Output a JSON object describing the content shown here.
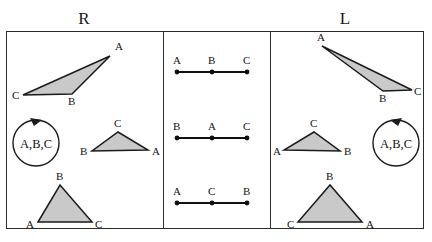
{
  "figure": {
    "width": 432,
    "height": 242,
    "background_color": "#ffffff",
    "border_color": "#2b2b2b",
    "shape_fill_color": "#c9c9c9",
    "shape_stroke_color": "#1b1b1b",
    "line_color": "#121212"
  },
  "headings": {
    "right_column": "R",
    "middle_column": "",
    "left_column": "L"
  },
  "panels": {
    "right_panel": {
      "name": "R",
      "orientation_marker": {
        "label": "A,B,C",
        "direction": "counterclockwise"
      },
      "triangles": [
        {
          "id": "r-triangle-1",
          "vertex_order": [
            "A",
            "B",
            "C"
          ],
          "labels": {
            "A": "A",
            "B": "B",
            "C": "C"
          },
          "points": {
            "A": [
              110,
              56
            ],
            "B": [
              72,
              94
            ],
            "C": [
              23,
              95
            ]
          },
          "label_pos": {
            "A": [
              115,
              50
            ],
            "B": [
              68,
              105
            ],
            "C": [
              12,
              99
            ]
          },
          "shape": "obtuse-sliver"
        },
        {
          "id": "r-triangle-2",
          "vertex_order": [
            "A",
            "B",
            "C"
          ],
          "labels": {
            "A": "A",
            "B": "B",
            "C": "C"
          },
          "points": {
            "A": [
              148,
              150
            ],
            "B": [
              92,
              151
            ],
            "C": [
              118,
              132
            ]
          },
          "label_pos": {
            "A": [
              152,
              155
            ],
            "B": [
              80,
              155
            ],
            "C": [
              115,
              127
            ]
          },
          "shape": "low-isosceles"
        },
        {
          "id": "r-triangle-3",
          "vertex_order": [
            "A",
            "B",
            "C"
          ],
          "labels": {
            "A": "A",
            "B": "B",
            "C": "C"
          },
          "points": {
            "A": [
              38,
              222
            ],
            "B": [
              60,
              185
            ],
            "C": [
              92,
              222
            ]
          },
          "label_pos": {
            "A": [
              27,
              227
            ],
            "B": [
              56,
              180
            ],
            "C": [
              96,
              227
            ]
          },
          "shape": "tall-isosceles"
        }
      ]
    },
    "middle_panel": {
      "name": "collinear",
      "segments": [
        {
          "id": "m-segment-1",
          "order": [
            "A",
            "B",
            "C"
          ],
          "labels": {
            "left": "A",
            "middle": "B",
            "right": "C"
          },
          "x_positions": [
            177,
            212,
            247
          ],
          "y": 72,
          "label_y": 64
        },
        {
          "id": "m-segment-2",
          "order": [
            "B",
            "A",
            "C"
          ],
          "labels": {
            "left": "B",
            "middle": "A",
            "right": "C"
          },
          "x_positions": [
            177,
            212,
            247
          ],
          "y": 138,
          "label_y": 130
        },
        {
          "id": "m-segment-3",
          "order": [
            "A",
            "C",
            "B"
          ],
          "labels": {
            "left": "A",
            "middle": "C",
            "right": "B"
          },
          "x_positions": [
            177,
            212,
            247
          ],
          "y": 203,
          "label_y": 195
        }
      ]
    },
    "left_panel": {
      "name": "L",
      "orientation_marker": {
        "label": "A,B,C",
        "direction": "clockwise"
      },
      "triangles": [
        {
          "id": "l-triangle-1",
          "vertex_order": [
            "A",
            "B",
            "C"
          ],
          "labels": {
            "A": "A",
            "B": "B",
            "C": "C"
          },
          "points": {
            "A": [
              322,
              46
            ],
            "B": [
              383,
              91
            ],
            "C": [
              412,
              90
            ]
          },
          "label_pos": {
            "A": [
              319,
              41
            ],
            "B": [
              380,
              102
            ],
            "C": [
              414,
              95
            ]
          },
          "shape": "obtuse-sliver-mirrored"
        },
        {
          "id": "l-triangle-2",
          "vertex_order": [
            "A",
            "B",
            "C"
          ],
          "labels": {
            "A": "A",
            "B": "B",
            "C": "C"
          },
          "points": {
            "A": [
              284,
              150
            ],
            "B": [
              340,
              151
            ],
            "C": [
              314,
              132
            ]
          },
          "label_pos": {
            "A": [
              273,
              155
            ],
            "B": [
              344,
              155
            ],
            "C": [
              311,
              127
            ]
          },
          "shape": "low-isosceles-mirrored"
        },
        {
          "id": "l-triangle-3",
          "vertex_order": [
            "A",
            "B",
            "C"
          ],
          "labels": {
            "A": "A",
            "B": "B",
            "C": "C"
          },
          "points": {
            "A": [
              362,
              222
            ],
            "B": [
              330,
              185
            ],
            "C": [
              298,
              222
            ]
          },
          "label_pos": {
            "A": [
              366,
              227
            ],
            "B": [
              326,
              180
            ],
            "C": [
              287,
              227
            ]
          },
          "shape": "tall-isosceles-mirrored"
        }
      ]
    }
  },
  "orientation_markers": {
    "right": {
      "label": "A,B,C",
      "cx": 36,
      "cy": 143,
      "r": 23,
      "direction": "counterclockwise"
    },
    "left": {
      "label": "A,B,C",
      "cx": 396,
      "cy": 143,
      "r": 23,
      "direction": "clockwise"
    }
  }
}
